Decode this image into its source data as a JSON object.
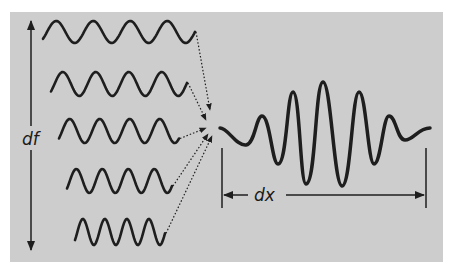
{
  "diagram": {
    "title": "",
    "colors": {
      "background": "#cdcdcd",
      "stroke": "#1e1e1e",
      "page": "#ffffff"
    },
    "labels": {
      "frequency_spread": "df",
      "spatial_extent": "dx"
    },
    "component_waves": [
      {
        "id": 1,
        "x_start": 43,
        "x_end": 195,
        "y_center": 32,
        "amplitude": 11,
        "period": 37,
        "cycles": 4
      },
      {
        "id": 2,
        "x_start": 51,
        "x_end": 187,
        "y_center": 84,
        "amplitude": 12,
        "period": 33,
        "cycles": 4
      },
      {
        "id": 3,
        "x_start": 59,
        "x_end": 179,
        "y_center": 131,
        "amplitude": 12,
        "period": 30,
        "cycles": 4
      },
      {
        "id": 4,
        "x_start": 67,
        "x_end": 172,
        "y_center": 181,
        "amplitude": 12,
        "period": 26,
        "cycles": 4
      },
      {
        "id": 5,
        "x_start": 75,
        "x_end": 165,
        "y_center": 232,
        "amplitude": 13,
        "period": 22,
        "cycles": 4
      }
    ],
    "convergence_point": {
      "x": 212,
      "y": 126
    },
    "wave_packet": {
      "x_start": 220,
      "x_end": 430,
      "y_center": 128,
      "description": "superposition of component waves forming localized wave packet"
    }
  }
}
